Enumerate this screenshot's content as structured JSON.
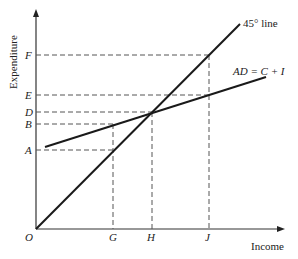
{
  "diagram": {
    "title": "",
    "y_axis_label": "Expenditure",
    "x_axis_label": "Income",
    "origin_label": "O",
    "line_45_label": "45°  line",
    "ad_label": "AD = C + I",
    "y_ticks": [
      {
        "label": "F",
        "y": 55
      },
      {
        "label": "E",
        "y": 95
      },
      {
        "label": "D",
        "y": 112
      },
      {
        "label": "B",
        "y": 124
      },
      {
        "label": "A",
        "y": 150
      }
    ],
    "x_ticks": [
      {
        "label": "G",
        "x": 113
      },
      {
        "label": "H",
        "x": 152
      },
      {
        "label": "J",
        "x": 209
      }
    ],
    "colors": {
      "line": "#1a1a1a",
      "dash": "#555555"
    }
  }
}
